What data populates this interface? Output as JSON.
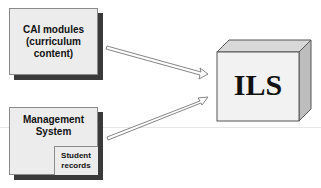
{
  "diagram": {
    "nodes": [
      {
        "id": "cai",
        "label_lines": [
          "CAI modules",
          "(curriculum",
          "content)"
        ]
      },
      {
        "id": "mgmt",
        "label_lines": [
          "Management",
          "System"
        ],
        "sub": {
          "label_lines": [
            "Student",
            "records"
          ]
        }
      },
      {
        "id": "ils",
        "label": "ILS",
        "shape": "3d-box"
      }
    ],
    "edges": [
      {
        "from": "cai",
        "to": "ils",
        "style": "hollow-arrow"
      },
      {
        "from": "mgmt",
        "to": "ils",
        "style": "hollow-arrow"
      }
    ]
  },
  "colors": {
    "box_fill": "#ececec",
    "shadow": "#3a3a3a",
    "border": "#8a8a8a"
  }
}
